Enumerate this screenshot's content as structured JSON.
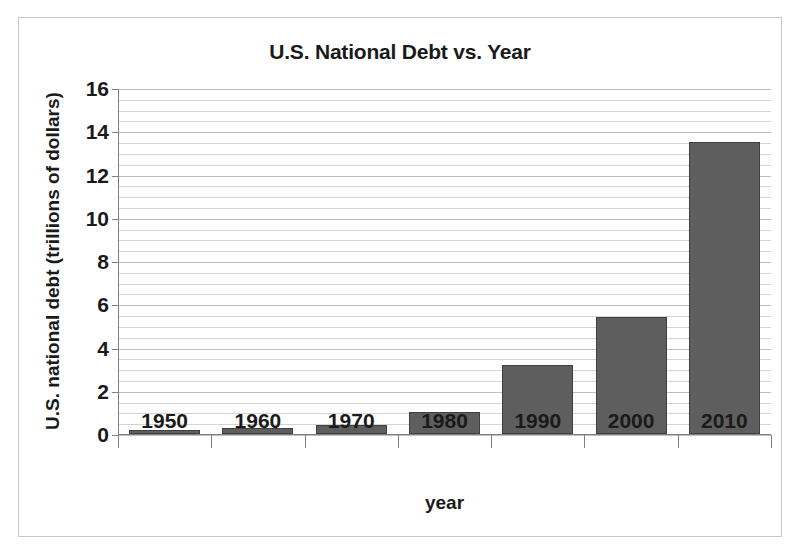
{
  "chart_data": {
    "type": "bar",
    "title": "U.S. National Debt vs. Year",
    "xlabel": "year",
    "ylabel": "U.S. national debt (trillions of dollars)",
    "categories": [
      "1950",
      "1960",
      "1970",
      "1980",
      "1990",
      "2000",
      "2010"
    ],
    "values": [
      0.2,
      0.3,
      0.4,
      1.0,
      3.2,
      5.4,
      13.5
    ],
    "ylim": [
      0,
      16
    ],
    "y_major_ticks": [
      0,
      2,
      4,
      6,
      8,
      10,
      12,
      14,
      16
    ],
    "y_tick_labels": [
      "0",
      "2",
      "4",
      "6",
      "8",
      "10",
      "12",
      "14",
      "16"
    ],
    "y_minor_step": 0.5,
    "grid": true,
    "grid_axis": "y",
    "legend": false,
    "bar_color": "#5e5e5e",
    "bar_edge_color": "#404040",
    "gridline_color": "#bfbfbf",
    "axis_color": "#808080",
    "text_color": "#1a1a1a",
    "background": "#ffffff",
    "frame_border_color": "#c9c9c9"
  }
}
